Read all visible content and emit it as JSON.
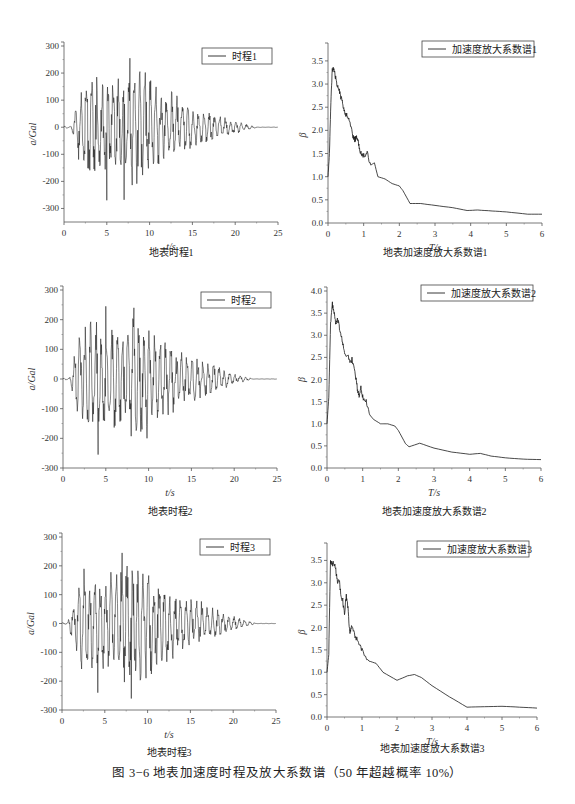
{
  "figure_caption": "图 3−6   地表加速度时程及放大系数谱（50 年超越概率 10%）",
  "captions": [
    "地表时程1",
    "地表加速度放大系数谱1",
    "地表时程2",
    "地表加速度放大系数谱2",
    "地表时程3",
    "地表加速度放大系数谱3"
  ],
  "chart_data": [
    {
      "id": "th1",
      "type": "line",
      "title": "地表时程1",
      "legend": "时程1",
      "xlabel": "t/s",
      "ylabel": "a/Gal",
      "xlim": [
        0,
        25
      ],
      "ylim": [
        -350,
        300
      ],
      "xticks": [
        0,
        5,
        10,
        15,
        20,
        25
      ],
      "yticks": [
        -300,
        -200,
        -100,
        0,
        100,
        200,
        300
      ],
      "envelope": {
        "onset": 0.8,
        "rise_end": 2.5,
        "peak_end": 10,
        "decay_end": 22.5,
        "peak_amp": 250,
        "neg_peak": -270
      },
      "peaks": [
        {
          "t": 7.7,
          "a": 255
        },
        {
          "t": 5.0,
          "a": -270
        },
        {
          "t": 7.0,
          "a": -268
        }
      ],
      "frame": {
        "left": 64,
        "top": 46,
        "width": 214,
        "height": 176
      }
    },
    {
      "id": "sp1",
      "type": "line",
      "title": "地表加速度放大系数谱1",
      "legend": "加速度放大系数谱1",
      "xlabel": "T/s",
      "ylabel": "β",
      "xlim": [
        0,
        6
      ],
      "ylim": [
        0,
        3.8
      ],
      "xticks": [
        0,
        1,
        2,
        3,
        4,
        5,
        6
      ],
      "yticks": [
        0.0,
        0.5,
        1.0,
        1.5,
        2.0,
        2.5,
        3.0,
        3.5
      ],
      "x": [
        0,
        0.04,
        0.08,
        0.12,
        0.16,
        0.2,
        0.25,
        0.3,
        0.35,
        0.4,
        0.45,
        0.5,
        0.55,
        0.6,
        0.7,
        0.75,
        0.8,
        0.85,
        0.9,
        0.95,
        1.0,
        1.1,
        1.2,
        1.3,
        1.4,
        1.6,
        1.8,
        2.0,
        2.1,
        2.3,
        2.6,
        3.0,
        3.5,
        3.9,
        4.2,
        4.6,
        5.0,
        5.6,
        6.0
      ],
      "y": [
        1.0,
        1.5,
        2.6,
        3.35,
        3.3,
        3.2,
        3.0,
        2.95,
        2.75,
        2.6,
        2.45,
        2.35,
        2.3,
        2.2,
        1.85,
        1.8,
        1.85,
        1.75,
        1.5,
        1.5,
        1.45,
        1.5,
        1.25,
        1.3,
        1.0,
        0.95,
        0.85,
        0.8,
        0.7,
        0.42,
        0.42,
        0.38,
        0.33,
        0.27,
        0.28,
        0.26,
        0.24,
        0.19,
        0.19
      ],
      "frame": {
        "left": 328,
        "top": 47,
        "width": 214,
        "height": 176
      }
    },
    {
      "id": "th2",
      "type": "line",
      "title": "地表时程2",
      "legend": "时程2",
      "xlabel": "t/s",
      "ylabel": "a/Gal",
      "xlim": [
        0,
        25
      ],
      "ylim": [
        -300,
        300
      ],
      "xticks": [
        0,
        5,
        10,
        15,
        20,
        25
      ],
      "yticks": [
        -300,
        -200,
        -100,
        0,
        100,
        200,
        300
      ],
      "envelope": {
        "onset": 0.8,
        "rise_end": 2.3,
        "peak_end": 10,
        "decay_end": 22,
        "peak_amp": 245,
        "neg_peak": -255
      },
      "peaks": [
        {
          "t": 5.0,
          "a": 245
        },
        {
          "t": 8.3,
          "a": 240
        },
        {
          "t": 4.1,
          "a": -255
        }
      ],
      "frame": {
        "left": 63,
        "top": 290,
        "width": 214,
        "height": 178
      }
    },
    {
      "id": "sp2",
      "type": "line",
      "title": "地表加速度放大系数谱2",
      "legend": "加速度放大系数谱2",
      "xlabel": "T/s",
      "ylabel": "β",
      "xlim": [
        0,
        6
      ],
      "ylim": [
        0,
        4.0
      ],
      "xticks": [
        0,
        1,
        2,
        3,
        4,
        5,
        6
      ],
      "yticks": [
        0.0,
        0.5,
        1.0,
        1.5,
        2.0,
        2.5,
        3.0,
        3.5,
        4.0
      ],
      "x": [
        0,
        0.05,
        0.1,
        0.15,
        0.2,
        0.25,
        0.3,
        0.35,
        0.4,
        0.45,
        0.5,
        0.6,
        0.65,
        0.7,
        0.8,
        0.85,
        0.9,
        0.95,
        1.0,
        1.1,
        1.2,
        1.3,
        1.5,
        1.6,
        1.7,
        1.9,
        2.0,
        2.2,
        2.3,
        2.6,
        3.0,
        3.5,
        4.0,
        4.3,
        4.6,
        5.0,
        5.5,
        6.0
      ],
      "y": [
        1.0,
        1.6,
        3.3,
        3.7,
        3.5,
        3.25,
        3.35,
        3.15,
        3.0,
        2.8,
        2.55,
        2.5,
        2.4,
        2.45,
        2.1,
        1.8,
        1.6,
        1.85,
        1.6,
        1.5,
        1.2,
        1.1,
        1.0,
        1.0,
        1.0,
        0.95,
        0.85,
        0.55,
        0.48,
        0.56,
        0.45,
        0.36,
        0.31,
        0.33,
        0.27,
        0.23,
        0.2,
        0.19
      ],
      "frame": {
        "left": 327,
        "top": 291,
        "width": 214,
        "height": 177
      }
    },
    {
      "id": "th3",
      "type": "line",
      "title": "地表时程3",
      "legend": "时程3",
      "xlabel": "t/s",
      "ylabel": "a/Gal",
      "xlim": [
        0,
        25
      ],
      "ylim": [
        -300,
        300
      ],
      "xticks": [
        0,
        5,
        10,
        15,
        20,
        25
      ],
      "yticks": [
        -300,
        -200,
        -100,
        0,
        100,
        200,
        300
      ],
      "envelope": {
        "onset": 0.7,
        "rise_end": 2.5,
        "peak_end": 10.5,
        "decay_end": 22.5,
        "peak_amp": 240,
        "neg_peak": -260
      },
      "peaks": [
        {
          "t": 7.0,
          "a": 245
        },
        {
          "t": 8.1,
          "a": -260
        },
        {
          "t": 4.2,
          "a": -240
        }
      ],
      "frame": {
        "left": 62,
        "top": 537,
        "width": 214,
        "height": 173
      }
    },
    {
      "id": "sp3",
      "type": "line",
      "title": "地表加速度放大系数谱3",
      "legend": "加速度放大系数谱3",
      "xlabel": "T/s",
      "ylabel": "β",
      "xlim": [
        0,
        6
      ],
      "ylim": [
        0,
        3.8
      ],
      "xticks": [
        0,
        1,
        2,
        3,
        4,
        5,
        6
      ],
      "yticks": [
        0.0,
        0.5,
        1.0,
        1.5,
        2.0,
        2.5,
        3.0,
        3.5
      ],
      "x": [
        0,
        0.05,
        0.1,
        0.15,
        0.2,
        0.25,
        0.3,
        0.35,
        0.4,
        0.45,
        0.5,
        0.55,
        0.6,
        0.65,
        0.7,
        0.8,
        0.9,
        1.0,
        1.2,
        1.4,
        1.6,
        2.0,
        2.3,
        2.5,
        2.7,
        3.0,
        3.5,
        4.0,
        4.5,
        5.0,
        5.5,
        6.0
      ],
      "y": [
        1.0,
        1.4,
        3.5,
        3.4,
        3.45,
        3.3,
        3.0,
        3.05,
        2.7,
        2.6,
        2.3,
        2.7,
        2.45,
        1.85,
        2.05,
        1.8,
        1.7,
        1.5,
        1.25,
        1.2,
        1.0,
        0.82,
        0.92,
        0.95,
        0.88,
        0.7,
        0.45,
        0.22,
        0.23,
        0.24,
        0.22,
        0.2
      ],
      "frame": {
        "left": 327,
        "top": 547,
        "width": 210,
        "height": 170
      }
    }
  ]
}
